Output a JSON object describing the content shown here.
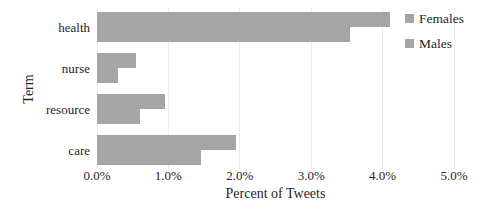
{
  "chart_data": {
    "type": "bar",
    "orientation": "horizontal",
    "title": "",
    "xlabel": "Percent of Tweets",
    "ylabel": "Term",
    "categories": [
      "health",
      "nurse",
      "resource",
      "care"
    ],
    "series": [
      {
        "name": "Females",
        "values": [
          4.1,
          0.55,
          0.95,
          1.95
        ]
      },
      {
        "name": "Males",
        "values": [
          3.55,
          0.3,
          0.6,
          1.45
        ]
      }
    ],
    "xlim": [
      0,
      5
    ],
    "xticks": [
      0,
      1,
      2,
      3,
      4,
      5
    ],
    "xtick_labels": [
      "0.0%",
      "1.0%",
      "2.0%",
      "3.0%",
      "4.0%",
      "5.0%"
    ],
    "grid": "vertical",
    "legend_position": "top-right"
  },
  "colors": {
    "bar_females": "#a5a5a5",
    "bar_males": "#a5a5a5",
    "gridline": "#ececec",
    "text": "#262626",
    "background": "#ffffff"
  }
}
